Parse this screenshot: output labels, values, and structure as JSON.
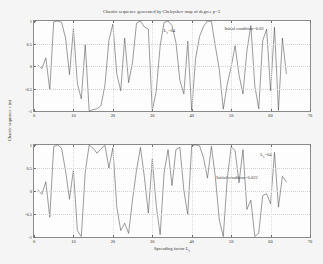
{
  "figure": {
    "title": "Chaotic sequence generated by Chebyshev map of degree p=3",
    "ylabel": "Chaotic sequence c (n)",
    "xlabel_main": "Spreading factor L",
    "xlabel_sub": "c",
    "background_color": "#f5f5f5",
    "axes_color": "#fdfdfd",
    "line_color": "#4a4a4a"
  },
  "axis": {
    "x_ticks": [
      "0",
      "10",
      "20",
      "30",
      "40",
      "50",
      "60",
      "70"
    ],
    "y_ticks": [
      "1",
      "0.5",
      "0",
      "-0.5",
      "-1"
    ],
    "xlim": [
      0,
      70
    ],
    "ylim": [
      -1,
      1
    ]
  },
  "top": {
    "annotation_lc_main": "L",
    "annotation_lc_sub": "c",
    "annotation_lc_value": "=64",
    "annotation_init": "Initial condition=0.02"
  },
  "bottom": {
    "annotation_lc_main": "L",
    "annotation_lc_sub": "c",
    "annotation_lc_value": "=64",
    "annotation_init": "Initial condition=0.022"
  },
  "chart_data": [
    {
      "type": "line",
      "title": "Chaotic sequence generated by Chebyshev map of degree p=3",
      "xlabel": "Spreading factor L_c",
      "ylabel": "Chaotic sequence c (n)",
      "xlim": [
        0,
        70
      ],
      "ylim": [
        -1,
        1
      ],
      "grid": true,
      "legend": null,
      "annotations": [
        "L_c=64",
        "Initial condition=0.02"
      ],
      "series_name": "initial condition 0.02",
      "x": [
        1,
        2,
        3,
        4,
        5,
        6,
        7,
        8,
        9,
        10,
        11,
        12,
        13,
        14,
        15,
        16,
        17,
        18,
        19,
        20,
        21,
        22,
        23,
        24,
        25,
        26,
        27,
        28,
        29,
        30,
        31,
        32,
        33,
        34,
        35,
        36,
        37,
        38,
        39,
        40,
        41,
        42,
        43,
        44,
        45,
        46,
        47,
        48,
        49,
        50,
        51,
        52,
        53,
        54,
        55,
        56,
        57,
        58,
        59,
        60,
        61,
        62,
        63,
        64
      ],
      "y": [
        0.02,
        -0.06,
        0.18,
        -0.53,
        0.98,
        1.0,
        0.97,
        0.62,
        -0.19,
        0.83,
        -0.39,
        -0.73,
        0.48,
        -1.0,
        -0.97,
        -0.95,
        -0.88,
        -0.42,
        0.57,
        0.93,
        -0.18,
        -0.55,
        0.62,
        -0.37,
        0.09,
        0.95,
        1.0,
        0.87,
        0.82,
        -0.99,
        -0.56,
        0.45,
        0.97,
        1.0,
        0.9,
        0.52,
        -0.32,
        -0.62,
        0.55,
        -0.99,
        0.18,
        0.66,
        0.88,
        1.0,
        0.99,
        0.44,
        -0.08,
        -0.96,
        -0.41,
        -0.02,
        0.45,
        -0.2,
        -0.62,
        0.34,
        0.9,
        -0.44,
        -0.95,
        0.56,
        0.82,
        -0.55,
        0.86,
        -0.99,
        0.62,
        -0.17
      ]
    },
    {
      "type": "line",
      "title": null,
      "xlabel": "Spreading factor L_c",
      "ylabel": "Chaotic sequence c (n)",
      "xlim": [
        0,
        70
      ],
      "ylim": [
        -1,
        1
      ],
      "grid": true,
      "legend": null,
      "annotations": [
        "L_c=64",
        "Initial condition=0.022"
      ],
      "series_name": "initial condition 0.022",
      "x": [
        1,
        2,
        3,
        4,
        5,
        6,
        7,
        8,
        9,
        10,
        11,
        12,
        13,
        14,
        15,
        16,
        17,
        18,
        19,
        20,
        21,
        22,
        23,
        24,
        25,
        26,
        27,
        28,
        29,
        30,
        31,
        32,
        33,
        34,
        35,
        36,
        37,
        38,
        39,
        40,
        41,
        42,
        43,
        44,
        45,
        46,
        47,
        48,
        49,
        50,
        51,
        52,
        53,
        54,
        55,
        56,
        57,
        58,
        59,
        60,
        61,
        62,
        63,
        64
      ],
      "y": [
        0.022,
        -0.07,
        0.2,
        -0.57,
        0.97,
        1.0,
        0.93,
        0.44,
        -0.18,
        0.46,
        -0.86,
        -0.99,
        0.42,
        1.0,
        0.93,
        0.82,
        0.92,
        0.99,
        0.5,
        0.94,
        -0.35,
        -0.86,
        -0.7,
        -0.92,
        -0.18,
        0.45,
        0.95,
        0.3,
        -0.48,
        0.69,
        -0.31,
        -0.95,
        0.4,
        0.9,
        0.12,
        0.9,
        0.95,
        0.02,
        -0.52,
        0.99,
        1.0,
        0.98,
        0.72,
        0.28,
        0.97,
        0.3,
        -0.63,
        -0.99,
        0.25,
        0.96,
        0.88,
        0.18,
        0.9,
        -0.4,
        -0.2,
        -0.99,
        -0.92,
        -0.1,
        -0.06,
        -0.28,
        0.84,
        -0.35,
        0.32,
        0.2
      ]
    }
  ]
}
